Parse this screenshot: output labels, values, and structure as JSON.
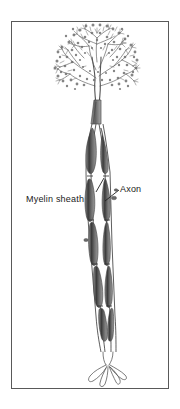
{
  "figure": {
    "domain": "Diagram",
    "background_color": "#ffffff",
    "frame": {
      "name": "figure-border",
      "border_color": "#595959",
      "fill_color": "#ffffff"
    },
    "ink_color": "#4a4a4a",
    "shade_color": "#6e6e6e",
    "dark_color": "#2b2b2b"
  },
  "labels": [
    {
      "id": "myelin-sheath",
      "text": "Myelin sheath",
      "leader": "up-right to axon node"
    },
    {
      "id": "axon",
      "text": "Axon",
      "leader": "down-left to axon fiber"
    }
  ],
  "parts": [
    {
      "id": "dendritic-tree",
      "name": "dendritic arbor"
    },
    {
      "id": "soma",
      "name": "cell body"
    },
    {
      "id": "axon-fiber",
      "name": "axon"
    },
    {
      "id": "myelin-segments",
      "name": "myelin sheath internodes"
    },
    {
      "id": "nodes-of-ranvier",
      "name": "nodes"
    },
    {
      "id": "axon-terminals",
      "name": "terminal branches"
    }
  ]
}
